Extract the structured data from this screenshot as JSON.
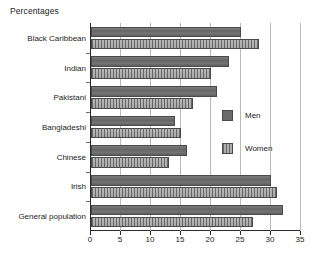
{
  "chart_data": {
    "type": "bar",
    "orientation": "horizontal",
    "title": "Percentages",
    "xlabel": "",
    "ylabel": "",
    "xlim": [
      0,
      35
    ],
    "xticks": [
      0,
      5,
      10,
      15,
      20,
      25,
      30,
      35
    ],
    "xtick_labels": [
      "0",
      "5",
      "10",
      "15",
      "20",
      "25",
      "30",
      "35"
    ],
    "grid": true,
    "grid_axis": "x",
    "legend_position": "right-middle",
    "categories": [
      "Black Caribbean",
      "Indian",
      "Pakistani",
      "Bangladeshi",
      "Chinese",
      "Irish",
      "General population"
    ],
    "series": [
      {
        "name": "Men",
        "color": "#6b6b6b",
        "pattern": "solid",
        "values": [
          25,
          23,
          21,
          14,
          16,
          30,
          32
        ]
      },
      {
        "name": "Women",
        "color": "#8d8d8d",
        "pattern": "hatched",
        "values": [
          28,
          20,
          17,
          15,
          13,
          31,
          27
        ]
      }
    ]
  },
  "legend": {
    "items": [
      {
        "label": "Men"
      },
      {
        "label": "Women"
      }
    ]
  }
}
